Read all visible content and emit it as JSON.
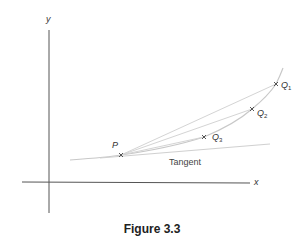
{
  "figure": {
    "caption": "Figure 3.3",
    "axes": {
      "x_label": "x",
      "y_label": "y"
    },
    "points": {
      "P": "P",
      "Q1": {
        "letter": "Q",
        "sub": "1"
      },
      "Q2": {
        "letter": "Q",
        "sub": "2"
      },
      "Q3": {
        "letter": "Q",
        "sub": "3"
      }
    },
    "tangent_label": "Tangent",
    "colors": {
      "axis": "#555555",
      "curve": "#c8c8c8",
      "marker": "#444444"
    }
  }
}
